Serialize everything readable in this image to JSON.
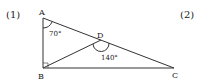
{
  "problem_labels": [
    "(1)",
    "(2)"
  ],
  "points": {
    "A": {
      "label": "A",
      "x": 43,
      "y": 18
    },
    "B": {
      "label": "B",
      "x": 43,
      "y": 68
    },
    "C": {
      "label": "C",
      "x": 174,
      "y": 68
    },
    "D": {
      "label": "D",
      "x": 101,
      "y": 40
    }
  },
  "angles": {
    "A": "70°",
    "D": "140°",
    "B_right_angle": true
  },
  "colors": {
    "stroke": "#333333",
    "text": "#222222"
  }
}
